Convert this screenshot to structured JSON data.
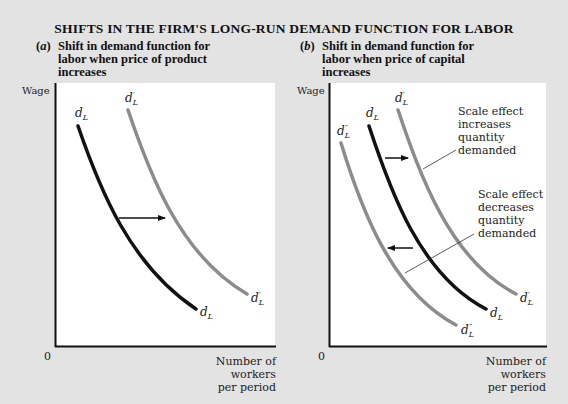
{
  "title": "SHIFTS IN THE FIRM'S LONG-RUN DEMAND FUNCTION FOR LABOR",
  "panels": [
    {
      "tag": "a",
      "subtitle_lines": [
        "Shift in demand function for",
        "labor when price of product",
        "increases"
      ],
      "y_axis_label": "Wage",
      "origin_label": "0",
      "x_axis_label_lines": [
        "Number of",
        "workers",
        "per period"
      ],
      "curves": [
        {
          "id": "dL",
          "label": "d",
          "sub": "L",
          "sup": "",
          "color": "#111111"
        },
        {
          "id": "dL_prime",
          "label": "d",
          "sub": "L",
          "sup": "′",
          "color": "#8c8c8c"
        }
      ],
      "arrow": {
        "direction": "right"
      }
    },
    {
      "tag": "b",
      "subtitle_lines": [
        "Shift in demand function for",
        "labor when price of capital",
        "increases"
      ],
      "y_axis_label": "Wage",
      "origin_label": "0",
      "x_axis_label_lines": [
        "Number of",
        "workers",
        "per period"
      ],
      "curves": [
        {
          "id": "dL_double_prime",
          "label": "d",
          "sub": "L",
          "sup": "″",
          "color": "#8c8c8c"
        },
        {
          "id": "dL",
          "label": "d",
          "sub": "L",
          "sup": "",
          "color": "#111111"
        },
        {
          "id": "dL_prime",
          "label": "d",
          "sub": "L",
          "sup": "′",
          "color": "#8c8c8c"
        }
      ],
      "annotations": [
        {
          "lines": [
            "Scale effect",
            "increases",
            "quantity",
            "demanded"
          ],
          "arrow": "right"
        },
        {
          "lines": [
            "Scale effect",
            "decreases",
            "quantity",
            "demanded"
          ],
          "arrow": "left"
        }
      ]
    }
  ],
  "colors": {
    "background": "#e3e3e3",
    "plot_bg": "#ffffff",
    "dark_curve": "#111111",
    "gray_curve": "#8c8c8c"
  }
}
